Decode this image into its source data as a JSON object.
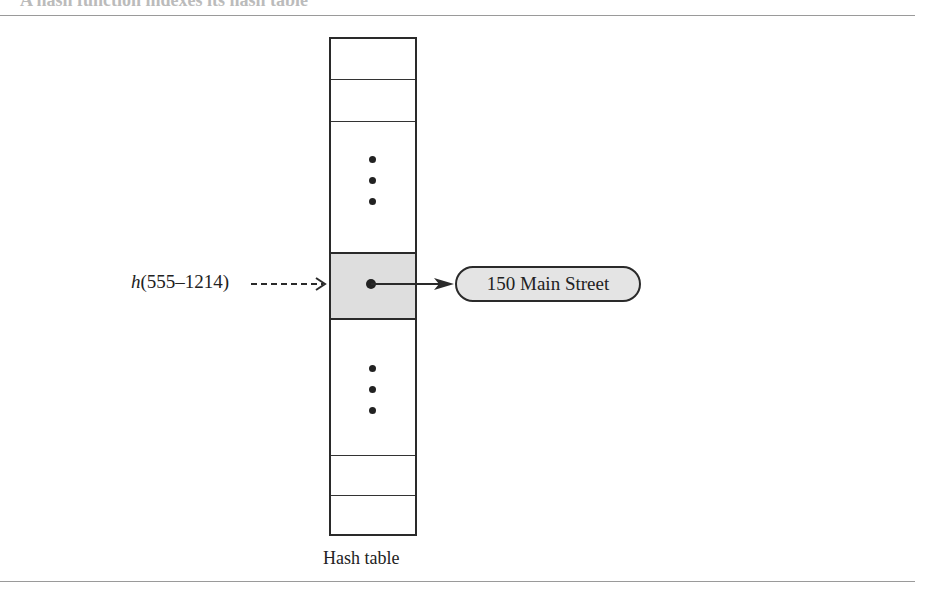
{
  "header": {
    "caption": "A hash function indexes its hash table"
  },
  "diagram": {
    "hash_call": {
      "function": "h",
      "argument": "(555–1214)"
    },
    "record": "150 Main Street",
    "table_caption": "Hash table",
    "colors": {
      "line": "#2a2a2a",
      "shaded_cell": "#dedede",
      "record_fill": "#e4e4e4",
      "rule": "#9a9a9a"
    }
  }
}
